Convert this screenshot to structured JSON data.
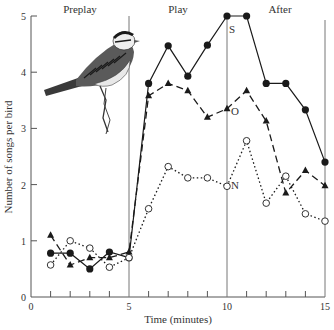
{
  "chart_data": {
    "type": "line",
    "title": "",
    "xlabel": "Time (minutes)",
    "ylabel": "Number of songs per bird",
    "xlim": [
      0,
      15
    ],
    "ylim": [
      0,
      5
    ],
    "x_ticks": [
      0,
      5,
      10,
      15
    ],
    "x_minor_ticks": [
      1,
      2,
      3,
      4,
      6,
      7,
      8,
      9,
      11,
      12,
      13,
      14
    ],
    "y_ticks": [
      0,
      1,
      2,
      3,
      4,
      5
    ],
    "grid": false,
    "legend": "inline labels (S, O, N)",
    "periods": [
      {
        "label": "Preplay",
        "start": 0,
        "end": 5
      },
      {
        "label": "Play",
        "start": 5,
        "end": 10
      },
      {
        "label": "After",
        "start": 10,
        "end": 15
      }
    ],
    "dividers": [
      5,
      10,
      15
    ],
    "x": [
      1,
      2,
      3,
      4,
      5,
      6,
      7,
      8,
      9,
      10,
      11,
      12,
      13,
      14,
      15
    ],
    "series": [
      {
        "name": "S",
        "marker": "filled-circle",
        "line_style": "solid",
        "label_position": {
          "x": 10.1,
          "y": 4.7
        },
        "values": [
          0.78,
          0.78,
          0.5,
          0.8,
          0.7,
          3.8,
          4.47,
          3.93,
          4.48,
          5.0,
          5.0,
          3.8,
          3.8,
          3.33,
          2.4
        ]
      },
      {
        "name": "O",
        "marker": "filled-triangle",
        "line_style": "dashed",
        "label_position": {
          "x": 10.2,
          "y": 3.23
        },
        "values": [
          1.1,
          0.57,
          0.7,
          0.7,
          0.8,
          3.58,
          3.8,
          3.67,
          3.2,
          3.35,
          3.67,
          3.13,
          1.85,
          2.25,
          1.98
        ]
      },
      {
        "name": "N",
        "marker": "open-circle",
        "line_style": "dotted",
        "label_position": {
          "x": 10.2,
          "y": 1.92
        },
        "values": [
          0.57,
          1.0,
          0.87,
          0.53,
          0.7,
          1.57,
          2.32,
          2.12,
          2.12,
          1.97,
          2.78,
          1.67,
          2.15,
          1.48,
          1.35
        ]
      }
    ],
    "annotations": [
      "Illustration of a sparrow perched on a twig in the Preplay region"
    ]
  },
  "colors": {
    "ink": "#1a1a1a",
    "axis": "#555555",
    "background": "#ffffff"
  },
  "illustration": {
    "name": "sparrow",
    "description": "white-crowned sparrow drawing"
  }
}
